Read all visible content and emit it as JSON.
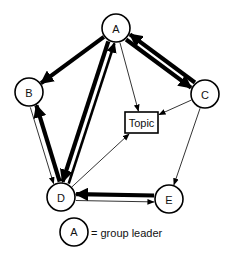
{
  "diagram": {
    "type": "communication-network",
    "nodes": [
      {
        "id": "A",
        "label": "A",
        "x": 116,
        "y": 28,
        "r": 14
      },
      {
        "id": "B",
        "label": "B",
        "x": 29,
        "y": 92,
        "r": 14
      },
      {
        "id": "C",
        "label": "C",
        "x": 205,
        "y": 94,
        "r": 14
      },
      {
        "id": "D",
        "label": "D",
        "x": 61,
        "y": 197,
        "r": 14
      },
      {
        "id": "E",
        "label": "E",
        "x": 169,
        "y": 199,
        "r": 14
      }
    ],
    "topic": {
      "label": "Topic",
      "x": 125,
      "y": 112,
      "w": 33,
      "h": 21
    },
    "edges": [
      {
        "from": "A",
        "to": "B",
        "weight": "heavy"
      },
      {
        "from": "A",
        "to": "C",
        "weight": "heavy"
      },
      {
        "from": "C",
        "to": "A",
        "weight": "heavy"
      },
      {
        "from": "A",
        "to": "D",
        "weight": "heavy"
      },
      {
        "from": "D",
        "to": "A",
        "weight": "medium"
      },
      {
        "from": "A",
        "to": "Topic",
        "weight": "light"
      },
      {
        "from": "C",
        "to": "Topic",
        "weight": "light"
      },
      {
        "from": "C",
        "to": "E",
        "weight": "light"
      },
      {
        "from": "B",
        "to": "D",
        "weight": "light"
      },
      {
        "from": "D",
        "to": "B",
        "weight": "heavy"
      },
      {
        "from": "D",
        "to": "Topic",
        "weight": "light"
      },
      {
        "from": "D",
        "to": "E",
        "weight": "light"
      },
      {
        "from": "E",
        "to": "D",
        "weight": "heavy"
      }
    ],
    "legend": {
      "symbol_label": "A",
      "text": "= group leader"
    },
    "colors": {
      "stroke": "#000000",
      "background": "#ffffff"
    }
  }
}
